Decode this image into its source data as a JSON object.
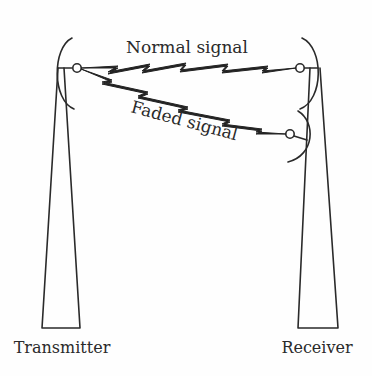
{
  "diagram": {
    "type": "radio-link-fading",
    "labels": {
      "normal_signal": "Normal signal",
      "faded_signal": "Faded signal",
      "transmitter": "Transmitter",
      "receiver": "Receiver"
    },
    "nodes": [
      {
        "id": "transmitter",
        "label": "Transmitter",
        "kind": "antenna-tower"
      },
      {
        "id": "receiver",
        "label": "Receiver",
        "kind": "antenna-tower"
      }
    ],
    "edges": [
      {
        "from": "transmitter",
        "to": "receiver",
        "label": "Normal signal",
        "style": "zigzag"
      },
      {
        "from": "transmitter",
        "to": "receiver-lower-antenna",
        "label": "Faded signal",
        "style": "zigzag"
      }
    ],
    "colors": {
      "line": "#2a2a2a",
      "background": "#fefefe"
    }
  }
}
